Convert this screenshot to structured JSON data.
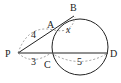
{
  "diagram": {
    "type": "geometry-secant-theorem",
    "points": {
      "P": {
        "label": "P"
      },
      "A": {
        "label": "A"
      },
      "B": {
        "label": "B"
      },
      "C": {
        "label": "C"
      },
      "D": {
        "label": "D"
      }
    },
    "segments": {
      "PA": {
        "label": "4"
      },
      "AB": {
        "label": "x"
      },
      "PC": {
        "label": "3"
      },
      "CD": {
        "label": "5"
      }
    },
    "colors": {
      "stroke": "#222222",
      "dashed": "#888888",
      "background": "#ffffff"
    }
  }
}
